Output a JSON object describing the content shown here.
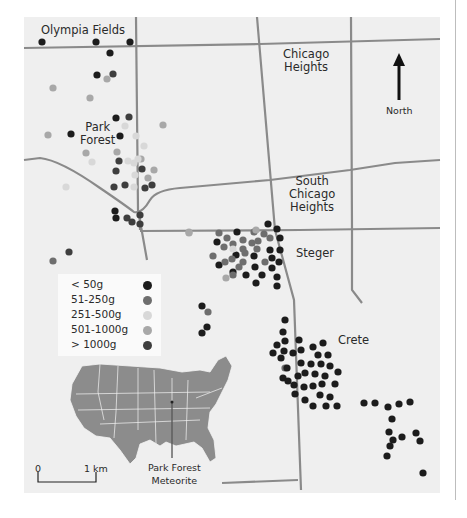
{
  "map": {
    "places": {
      "olympia_fields": "Olympia Fields",
      "chicago_heights_1": "Chicago",
      "chicago_heights_2": "Heights",
      "park_forest_1": "Park",
      "park_forest_2": "Forest",
      "south_chicago_heights_1": "South",
      "south_chicago_heights_2": "Chicago",
      "south_chicago_heights_3": "Heights",
      "steger": "Steger",
      "crete": "Crete"
    },
    "north_arrow_label": "North",
    "scale_bar": {
      "start": "0",
      "end": "1 km"
    },
    "inset": {
      "label_1": "Park Forest",
      "label_2": "Meteorite",
      "region": "Contiguous United States"
    },
    "legend": {
      "title": "Meteorite fragment mass",
      "items": [
        {
          "label": "< 50g",
          "color": "#1c1c1c"
        },
        {
          "label": "51-250g",
          "color": "#6e6e6e"
        },
        {
          "label": "251-500g",
          "color": "#d8d8d8"
        },
        {
          "label": "501-1000g",
          "color": "#a8a8a8"
        },
        {
          "label": "> 1000g",
          "color": "#3e3e3e"
        }
      ]
    },
    "colors": {
      "background": "#efefef",
      "road": "#8a8a8a",
      "inset_fill": "#8c8c8c"
    }
  }
}
